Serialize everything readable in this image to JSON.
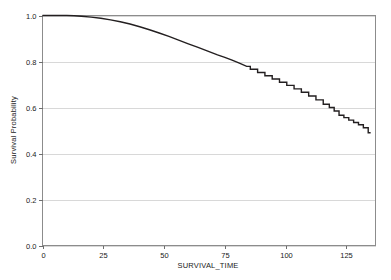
{
  "chart_data": {
    "type": "line",
    "title": "",
    "xlabel": "SURVIVAL_TIME",
    "ylabel": "Survival Probability",
    "xlim": [
      0,
      137
    ],
    "ylim": [
      0.0,
      1.0
    ],
    "grid": true,
    "legend": false,
    "xticks": [
      0,
      25,
      50,
      75,
      100,
      125
    ],
    "xtick_labels": [
      "0",
      "25",
      "50",
      "75",
      "100",
      "125"
    ],
    "yticks": [
      0.0,
      0.2,
      0.4,
      0.6,
      0.8,
      1.0
    ],
    "ytick_labels": [
      "0.0",
      "0.2",
      "0.4",
      "0.6",
      "0.8",
      "1.0"
    ],
    "line_color": "#231f20",
    "grid_color": "#d8d8d8",
    "frame_color": "#8c8c8c",
    "series": [
      {
        "name": "Survival Probability",
        "step": true,
        "x": [
          0,
          5,
          10,
          13,
          16,
          20,
          24,
          28,
          32,
          36,
          40,
          44,
          48,
          52,
          56,
          60,
          64,
          68,
          72,
          75,
          78,
          81,
          84,
          87,
          90,
          93,
          96,
          99,
          102,
          105,
          108,
          111,
          114,
          117,
          119,
          121,
          123,
          125,
          127,
          129,
          131,
          133,
          135
        ],
        "y": [
          1.0,
          1.0,
          1.0,
          0.999,
          0.997,
          0.993,
          0.988,
          0.981,
          0.973,
          0.963,
          0.951,
          0.938,
          0.924,
          0.909,
          0.893,
          0.877,
          0.861,
          0.845,
          0.829,
          0.818,
          0.806,
          0.793,
          0.779,
          0.766,
          0.752,
          0.738,
          0.724,
          0.71,
          0.696,
          0.681,
          0.666,
          0.65,
          0.633,
          0.614,
          0.6,
          0.585,
          0.566,
          0.556,
          0.545,
          0.535,
          0.525,
          0.512,
          0.49
        ]
      }
    ]
  },
  "axis": {
    "x_title": "SURVIVAL_TIME",
    "y_title": "Survival Probability"
  }
}
